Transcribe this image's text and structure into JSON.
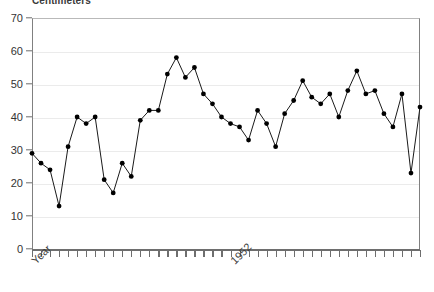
{
  "chart_data": {
    "type": "line",
    "title": "Centimeters",
    "xlabel": "Year",
    "ylabel": "",
    "ylim": [
      0,
      70
    ],
    "ytick_labels": [
      "0",
      "10",
      "20",
      "30",
      "40",
      "50",
      "60",
      "70"
    ],
    "yticks": [
      0,
      10,
      20,
      30,
      40,
      50,
      60,
      70
    ],
    "grid": true,
    "legend": "none",
    "marker": "filled-circle",
    "line_color": "#1a1a1a",
    "marker_color": "#000000",
    "xtick_labels": [
      "Year",
      "1952"
    ],
    "x_axis_caption_left": "Year",
    "x_axis_caption_mid": "1952",
    "x_caption_mid_index": 22,
    "n_points": 44,
    "values": [
      29,
      26,
      24,
      13,
      31,
      40,
      38,
      40,
      21,
      17,
      26,
      22,
      39,
      42,
      42,
      53,
      58,
      52,
      55,
      47,
      44,
      40,
      38,
      37,
      33,
      42,
      38,
      31,
      41,
      45,
      51,
      46,
      44,
      47,
      40,
      48,
      54,
      47,
      48,
      41,
      37,
      47,
      23,
      43
    ],
    "y_min_value": 13,
    "y_max_value": 58
  }
}
